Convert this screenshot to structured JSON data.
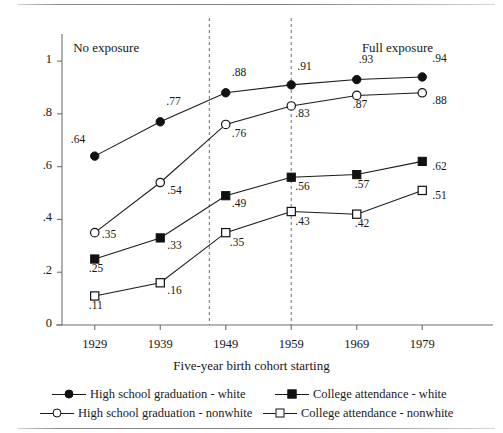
{
  "figure": {
    "xlabel": "Five-year birth cohort starting",
    "zone_left": "No exposure",
    "zone_right": "Full exposure"
  },
  "chart_data": {
    "type": "line",
    "title": "",
    "subtitle": "",
    "xlabel": "Five-year birth cohort starting",
    "ylabel": "",
    "categories": [
      "1929",
      "1939",
      "1949",
      "1959",
      "1969",
      "1979"
    ],
    "x": [
      1929,
      1939,
      1949,
      1959,
      1969,
      1979
    ],
    "xlim": [
      1924,
      1984
    ],
    "ylim": [
      0,
      1.08
    ],
    "yticks": [
      "0",
      ".2",
      ".4",
      ".6",
      ".8",
      "1"
    ],
    "ytick_values": [
      0,
      0.2,
      0.4,
      0.6,
      0.8,
      1
    ],
    "grid": false,
    "legend_position": "bottom",
    "annotations": [
      {
        "text": "No exposure",
        "x": 1931.5,
        "y": 1.05
      },
      {
        "text": "Full exposure",
        "x": 1976.5,
        "y": 1.05
      }
    ],
    "reference_lines": [
      {
        "orientation": "vertical",
        "x": 1946.5,
        "style": "dashed"
      },
      {
        "orientation": "vertical",
        "x": 1959.0,
        "style": "dashed"
      }
    ],
    "series": [
      {
        "name": "High school graduation - white",
        "marker": "circle-filled",
        "line": "solid",
        "values": [
          0.64,
          0.77,
          0.88,
          0.91,
          0.93,
          0.94
        ],
        "labels": [
          ".64",
          ".77",
          ".88",
          ".91",
          ".93",
          ".94"
        ]
      },
      {
        "name": "High school graduation - nonwhite",
        "marker": "circle-open",
        "line": "solid",
        "values": [
          0.35,
          0.54,
          0.76,
          0.83,
          0.87,
          0.88
        ],
        "labels": [
          ".35",
          ".54",
          ".76",
          ".83",
          ".87",
          ".88"
        ]
      },
      {
        "name": "College attendance - white",
        "marker": "square-filled",
        "line": "solid",
        "values": [
          0.25,
          0.33,
          0.49,
          0.56,
          0.57,
          0.62
        ],
        "labels": [
          ".25",
          ".33",
          ".49",
          ".56",
          ".57",
          ".62"
        ]
      },
      {
        "name": "College attendance - nonwhite",
        "marker": "square-open",
        "line": "solid",
        "values": [
          0.11,
          0.16,
          0.35,
          0.43,
          0.42,
          0.51
        ],
        "labels": [
          ".11",
          ".16",
          ".35",
          ".43",
          ".42",
          ".51"
        ]
      }
    ]
  },
  "legend": {
    "items": [
      {
        "label": "High school graduation - white",
        "marker": "circle-filled"
      },
      {
        "label": "High school graduation - nonwhite",
        "marker": "circle-open"
      },
      {
        "label": "College attendance - white",
        "marker": "square-filled"
      },
      {
        "label": "College attendance - nonwhite",
        "marker": "square-open"
      }
    ]
  },
  "colors": {
    "ink": "#1a1a1a",
    "axis": "#6f6f6f",
    "dashed": "#7a7a7a"
  }
}
